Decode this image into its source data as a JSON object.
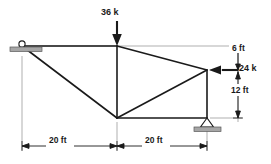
{
  "figure": {
    "colors": {
      "member": "#1a1a1a",
      "dimension": "#4d4d4d",
      "support_hatch": "#999999",
      "background": "#ffffff",
      "text": "#1a1a1a"
    }
  },
  "loads": [
    {
      "id": "top-load",
      "label": "36 k",
      "magnitude": 36,
      "unit": "k",
      "direction": "down",
      "applied_at": "top-center-joint"
    },
    {
      "id": "right-load",
      "label": "24 k",
      "magnitude": 24,
      "unit": "k",
      "direction": "left",
      "applied_at": "right-upper-joint"
    }
  ],
  "dimensions": [
    {
      "id": "vert-6ft",
      "label": "6 ft",
      "value": 6,
      "unit": "ft",
      "orientation": "vertical"
    },
    {
      "id": "vert-12ft",
      "label": "12 ft",
      "value": 12,
      "unit": "ft",
      "orientation": "vertical"
    },
    {
      "id": "horiz-left-20ft",
      "label": "20 ft",
      "value": 20,
      "unit": "ft",
      "orientation": "horizontal"
    },
    {
      "id": "horiz-right-20ft",
      "label": "20 ft",
      "value": 20,
      "unit": "ft",
      "orientation": "horizontal"
    }
  ],
  "supports": [
    {
      "id": "left-support",
      "type": "roller",
      "position": "top-left-joint"
    },
    {
      "id": "right-support",
      "type": "pin",
      "position": "bottom-right-joint"
    }
  ],
  "joints": [
    {
      "id": "A",
      "name": "top-left-joint",
      "x": 22,
      "y": 46
    },
    {
      "id": "B",
      "name": "top-center-joint",
      "x": 117,
      "y": 46
    },
    {
      "id": "C",
      "name": "right-upper-joint",
      "x": 207,
      "y": 70
    },
    {
      "id": "D",
      "name": "bottom-center-joint",
      "x": 117,
      "y": 118
    },
    {
      "id": "E",
      "name": "bottom-right-joint",
      "x": 207,
      "y": 118
    }
  ],
  "members": [
    {
      "id": "AB",
      "from": "A",
      "to": "B"
    },
    {
      "id": "BC",
      "from": "B",
      "to": "C"
    },
    {
      "id": "AD",
      "from": "A",
      "to": "D"
    },
    {
      "id": "BD",
      "from": "B",
      "to": "D"
    },
    {
      "id": "CD",
      "from": "C",
      "to": "D"
    },
    {
      "id": "DE",
      "from": "D",
      "to": "E"
    },
    {
      "id": "CE",
      "from": "C",
      "to": "E"
    }
  ]
}
